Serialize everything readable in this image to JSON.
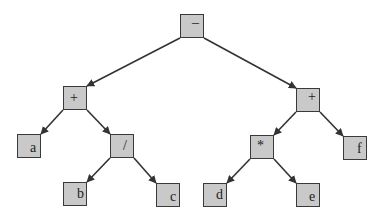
{
  "diagram": {
    "type": "expression-tree",
    "colors": {
      "node_fill": "#c9c9c9",
      "node_border": "#3a3a3a",
      "edge": "#333333",
      "background": "#ffffff"
    },
    "nodes": [
      {
        "id": "root",
        "label": "–",
        "x": 180,
        "y": 14,
        "lx": 11,
        "ly": 1
      },
      {
        "id": "plusL",
        "label": "+",
        "x": 63,
        "y": 86,
        "lx": 6,
        "ly": 4
      },
      {
        "id": "plusR",
        "label": "+",
        "x": 296,
        "y": 88,
        "lx": 11,
        "ly": 1
      },
      {
        "id": "a",
        "label": "a",
        "x": 17,
        "y": 134,
        "lx": 12,
        "ly": 6
      },
      {
        "id": "div",
        "label": "/",
        "x": 110,
        "y": 134,
        "lx": 12,
        "ly": 4
      },
      {
        "id": "mul",
        "label": "*",
        "x": 250,
        "y": 135,
        "lx": 6,
        "ly": 3
      },
      {
        "id": "f",
        "label": "f",
        "x": 343,
        "y": 136,
        "lx": 13,
        "ly": 5
      },
      {
        "id": "b",
        "label": "b",
        "x": 63,
        "y": 182,
        "lx": 13,
        "ly": 4
      },
      {
        "id": "c",
        "label": "c",
        "x": 156,
        "y": 183,
        "lx": 13,
        "ly": 6
      },
      {
        "id": "d",
        "label": "d",
        "x": 203,
        "y": 183,
        "lx": 12,
        "ly": 4
      },
      {
        "id": "e",
        "label": "e",
        "x": 296,
        "y": 183,
        "lx": 12,
        "ly": 6
      }
    ],
    "edges": [
      {
        "from": "root",
        "to": "plusL"
      },
      {
        "from": "root",
        "to": "plusR"
      },
      {
        "from": "plusL",
        "to": "a"
      },
      {
        "from": "plusL",
        "to": "div"
      },
      {
        "from": "div",
        "to": "b"
      },
      {
        "from": "div",
        "to": "c"
      },
      {
        "from": "plusR",
        "to": "mul"
      },
      {
        "from": "plusR",
        "to": "f"
      },
      {
        "from": "mul",
        "to": "d"
      },
      {
        "from": "mul",
        "to": "e"
      }
    ]
  }
}
